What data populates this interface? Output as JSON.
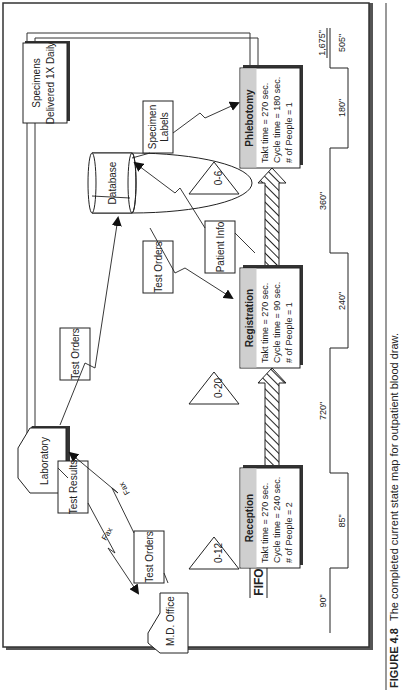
{
  "figure": {
    "caption_label": "FIGURE 4.8",
    "caption_text": "The completed current state map for outpatient blood draw."
  },
  "external_entities": {
    "md_office": "M.D. Office",
    "laboratory": "Laboratory",
    "database": "Database"
  },
  "info_boxes": {
    "test_results": "Test Results",
    "test_orders_md": "Test Orders",
    "test_orders_lab": "Test Orders",
    "test_orders_db": "Test Orders",
    "patient_info": "Patient Info",
    "specimen_labels_1": "Specimen",
    "specimen_labels_2": "Labels",
    "specimens_delivered_1": "Specimens",
    "specimens_delivered_2": "Delivered 1X Daily"
  },
  "flow_labels": {
    "fax_1": "Fax",
    "fax_2": "Fax",
    "fifo": "FIFO"
  },
  "inventory": {
    "before_reception": "0-12",
    "before_registration": "0-20",
    "before_phlebotomy": "0-6"
  },
  "processes": [
    {
      "name": "Reception",
      "takt": "Takt time = 270 sec.",
      "cycle": "Cycle time = 240 sec.",
      "people": "# of People = 2"
    },
    {
      "name": "Registration",
      "takt": "Takt time = 270 sec.",
      "cycle": "Cycle time = 90 sec.",
      "people": "# of People = 1"
    },
    {
      "name": "Phlebotomy",
      "takt": "Takt time = 270 sec.",
      "cycle": "Cycle time = 180 sec.",
      "people": "# of People = 1"
    }
  ],
  "timeline": {
    "wait": [
      "90\"",
      "720\"",
      "360\""
    ],
    "process": [
      "85\"",
      "240\"",
      "180\""
    ],
    "total_lead": "1,675\"",
    "total_process": "505\""
  },
  "colors": {
    "process_header": "#cfcfcf",
    "line": "#222222",
    "frame_shadow": "#333333"
  }
}
